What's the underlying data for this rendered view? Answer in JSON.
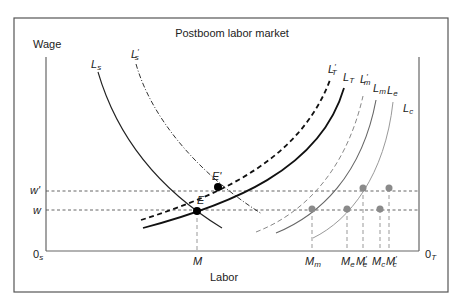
{
  "title": "Postboom labor market",
  "axes": {
    "y_label": "Wage",
    "x_label": "Labor",
    "origin_left": "0",
    "origin_left_sub": "s",
    "origin_right": "0",
    "origin_right_sub": "T"
  },
  "wage_levels": {
    "w_prime": "w'",
    "w": "w"
  },
  "equilibria": {
    "E": "E",
    "E_prime": "E'"
  },
  "x_markers": {
    "M": "M",
    "M_m": "M",
    "M_m_sub": "m",
    "M_e": "M",
    "M_e_sub": "e",
    "M_e_prime": "M",
    "M_e_prime_sub": "e",
    "M_c": "M",
    "M_c_sub": "c",
    "M_c_prime": "M",
    "M_c_prime_sub": "c"
  },
  "curves": {
    "Ls": {
      "base": "L",
      "sub": "s",
      "prime": ""
    },
    "Ls_prime": {
      "base": "L",
      "sub": "s",
      "prime": "′"
    },
    "LT_prime": {
      "base": "L",
      "sub": "T",
      "prime": "′"
    },
    "LT": {
      "base": "L",
      "sub": "T",
      "prime": ""
    },
    "Lm_prime": {
      "base": "L",
      "sub": "m",
      "prime": "′"
    },
    "Lm": {
      "base": "L",
      "sub": "m",
      "prime": ""
    },
    "Le": {
      "base": "L",
      "sub": "e",
      "prime": ""
    },
    "Lc": {
      "base": "L",
      "sub": "c",
      "prime": ""
    }
  },
  "colors": {
    "frame": "#555555",
    "axis": "#666666",
    "dark_curve": "#111111",
    "gray_curve": "#777777",
    "light_curve": "#9a9a9a",
    "gray_point": "#8a8a8a",
    "black_point": "#000000"
  }
}
